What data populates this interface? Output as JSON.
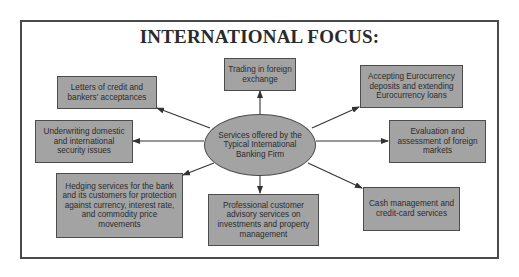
{
  "title": "INTERNATIONAL FOCUS:",
  "center": {
    "label": "Services offered by the Typical International Banking Firm"
  },
  "services": [
    {
      "id": "letters-of-credit",
      "label": "Letters of credit and bankers' acceptances"
    },
    {
      "id": "foreign-exchange",
      "label": "Trading in foreign exchange"
    },
    {
      "id": "eurocurrency",
      "label": "Accepting Eurocurrency deposits and extending Eurocurrency loans"
    },
    {
      "id": "underwriting",
      "label": "Underwriting domestic and international security issues"
    },
    {
      "id": "evaluation",
      "label": "Evaluation and assessment of foreign markets"
    },
    {
      "id": "hedging",
      "label": "Hedging services for the bank and its customers for protection against currency, interest rate, and commodity price movements"
    },
    {
      "id": "advisory",
      "label": "Professional customer advisory services on investments and property management"
    },
    {
      "id": "cash-management",
      "label": "Cash management and credit-card services"
    }
  ],
  "colors": {
    "box_fill": "#a3a3a3",
    "box_border": "#4c4c4c",
    "frame_border": "#4a4a4a",
    "arrow": "#333333",
    "text": "#2c2c2c"
  }
}
